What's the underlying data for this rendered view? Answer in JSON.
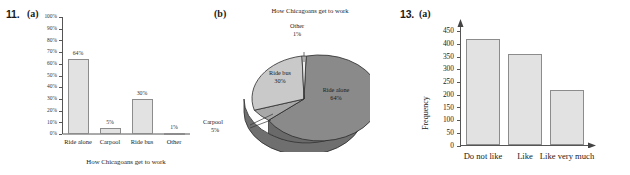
{
  "exercise_a": {
    "number": "11.",
    "part": "(a)",
    "chart_data": {
      "type": "bar",
      "title": "",
      "xlabel": "How Chicagoans get to work",
      "ylabel": "",
      "categories": [
        "Ride alone",
        "Carpool",
        "Ride bus",
        "Other"
      ],
      "values": [
        64,
        5,
        30,
        1
      ],
      "value_labels": [
        "64%",
        "5%",
        "30%",
        "1%"
      ],
      "ylim": [
        0,
        100
      ],
      "ytick_values": [
        0,
        10,
        20,
        30,
        40,
        50,
        60,
        70,
        80,
        90,
        100
      ],
      "ytick_labels": [
        "0%",
        "10%",
        "20%",
        "30%",
        "40%",
        "50%",
        "60%",
        "70%",
        "80%",
        "90%",
        "100%"
      ],
      "grid": false,
      "legend": "none",
      "bar_fill": "#e2e2e2",
      "bar_stroke": "#8c8c8c"
    }
  },
  "exercise_b": {
    "part": "(b)",
    "chart_data": {
      "type": "pie",
      "title": "How Chicagoans get to work",
      "labels": [
        "Ride alone",
        "Ride bus",
        "Carpool",
        "Other"
      ],
      "values": [
        64,
        30,
        5,
        1
      ],
      "value_labels": [
        "64%",
        "30%",
        "5%",
        "1%"
      ],
      "slice_colors": [
        "#8a8a8a",
        "#c8c8c8",
        "#a8a8a8",
        "#e8e8e8"
      ],
      "label_positions": [
        "inside",
        "inside",
        "callout",
        "callout"
      ],
      "legend": "none",
      "style": "3d"
    }
  },
  "exercise_c": {
    "number": "13.",
    "part": "(a)",
    "chart_data": {
      "type": "bar",
      "title": "",
      "xlabel": "",
      "ylabel": "Frequency",
      "categories": [
        "Do not like",
        "Like",
        "Like very much"
      ],
      "values": [
        420,
        360,
        220
      ],
      "ylim": [
        0,
        470
      ],
      "ytick_values": [
        0,
        50,
        100,
        150,
        200,
        250,
        300,
        350,
        400,
        450
      ],
      "ytick_labels": [
        "0",
        "50",
        "100",
        "150",
        "200",
        "250",
        "300",
        "350",
        "400",
        "450"
      ],
      "grid": false,
      "legend": "none",
      "bar_fill": "#e2e2e2",
      "bar_stroke": "#8c8c8c"
    }
  }
}
